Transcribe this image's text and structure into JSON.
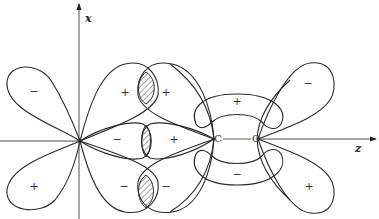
{
  "diagram": {
    "type": "molecular-orbital-overlap",
    "axes": {
      "vertical_label": "x",
      "horizontal_label": "z"
    },
    "atoms": {
      "carbon": "C",
      "oxygen": "O"
    },
    "signs": {
      "far_left_upper": "−",
      "far_left_lower": "+",
      "mid_upper_left": "+",
      "mid_upper_right": "+",
      "mid_lower_left": "−",
      "mid_lower_right": "−",
      "center_left": "−",
      "center_right": "+",
      "pi_upper": "+",
      "pi_lower": "−",
      "far_right_upper": "−",
      "far_right_lower": "+"
    },
    "colors": {
      "line": "#2a2a2a",
      "background": "#ffffff"
    }
  }
}
